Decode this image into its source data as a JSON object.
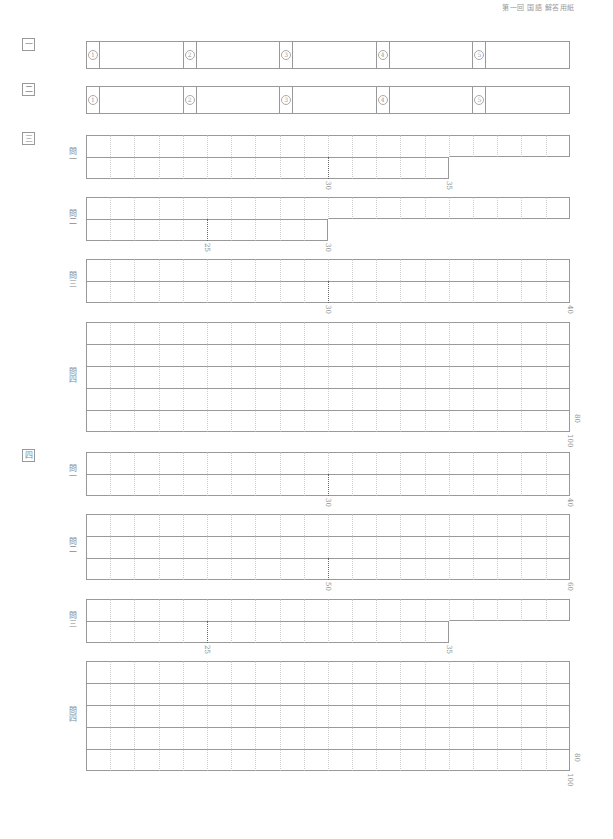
{
  "header": {
    "text": "第一回 国語 解答用紙"
  },
  "sections": [
    {
      "id": "sec1",
      "label": "一",
      "top": 44,
      "type": "choice",
      "items": [
        {
          "n": "①"
        },
        {
          "n": "②"
        },
        {
          "n": "③"
        },
        {
          "n": "④"
        },
        {
          "n": "⑤"
        }
      ]
    },
    {
      "id": "sec2",
      "label": "二",
      "top": 89,
      "type": "choice",
      "items": [
        {
          "n": "①"
        },
        {
          "n": "②"
        },
        {
          "n": "③"
        },
        {
          "n": "④"
        },
        {
          "n": "⑤"
        }
      ]
    },
    {
      "id": "sec3",
      "label": "三",
      "top": 138,
      "type": "essay",
      "questions": [
        {
          "label": "問一",
          "top": 135,
          "rows": [
            20,
            15
          ],
          "dotted": [
            {
              "row": 1,
              "col": 10,
              "label": "30"
            }
          ],
          "end_label": "35"
        },
        {
          "label": "問二",
          "top": 197,
          "rows": [
            20,
            10
          ],
          "dotted": [
            {
              "row": 1,
              "col": 5,
              "label": "25"
            }
          ],
          "end_label": "30"
        },
        {
          "label": "問三",
          "top": 259,
          "rows": [
            20,
            20
          ],
          "dotted": [
            {
              "row": 1,
              "col": 10,
              "label": "30"
            }
          ],
          "end_label": "40"
        },
        {
          "label": "問四",
          "top": 322,
          "rows": [
            20,
            20,
            20,
            20,
            20
          ],
          "dotted": [],
          "mid_label": "80",
          "end_label": "100"
        }
      ]
    },
    {
      "id": "sec4",
      "label": "四",
      "top": 455,
      "type": "essay",
      "questions": [
        {
          "label": "問一",
          "top": 452,
          "rows": [
            20,
            20
          ],
          "dotted": [
            {
              "row": 1,
              "col": 10,
              "label": "30"
            }
          ],
          "end_label": "40"
        },
        {
          "label": "問二",
          "top": 514,
          "rows": [
            20,
            20,
            20
          ],
          "dotted": [
            {
              "row": 2,
              "col": 10,
              "label": "50"
            }
          ],
          "end_label": "60"
        },
        {
          "label": "問三",
          "top": 599,
          "rows": [
            20,
            15
          ],
          "dotted": [
            {
              "row": 1,
              "col": 5,
              "label": "25"
            }
          ],
          "end_label": "35"
        },
        {
          "label": "問四",
          "top": 661,
          "rows": [
            20,
            20,
            20,
            20,
            20
          ],
          "dotted": [],
          "mid_label": "80",
          "end_label": "100"
        }
      ]
    }
  ]
}
